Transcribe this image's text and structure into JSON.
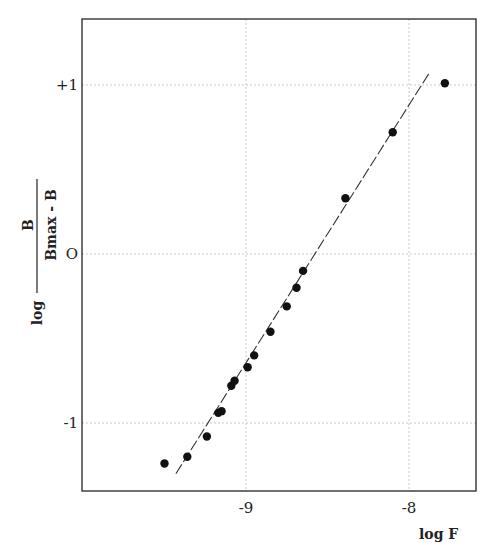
{
  "chart_data": {
    "type": "scatter",
    "title": "",
    "xlabel": "log F",
    "ylabel": "log B / (Bmax - B)",
    "ylabel_parts": {
      "log": "log",
      "numerator": "B",
      "denominator": "Bmax - B"
    },
    "xlim": [
      -9.5,
      -7.8
    ],
    "ylim": [
      -1.4,
      1.4
    ],
    "x_ticks": [
      {
        "value": -9,
        "label": "-9"
      },
      {
        "value": -8,
        "label": "-8"
      }
    ],
    "y_ticks": [
      {
        "value": 1,
        "label": "+1"
      },
      {
        "value": 0,
        "label": "O"
      },
      {
        "value": -1,
        "label": "-1"
      }
    ],
    "grid": "dotted at ticks",
    "legend": null,
    "series": [
      {
        "name": "data",
        "marker": "filled-circle",
        "points": [
          {
            "x": -9.5,
            "y": -1.24
          },
          {
            "x": -9.36,
            "y": -1.2
          },
          {
            "x": -9.24,
            "y": -1.08
          },
          {
            "x": -9.17,
            "y": -0.94
          },
          {
            "x": -9.15,
            "y": -0.93
          },
          {
            "x": -9.09,
            "y": -0.78
          },
          {
            "x": -9.07,
            "y": -0.75
          },
          {
            "x": -8.99,
            "y": -0.67
          },
          {
            "x": -8.95,
            "y": -0.6
          },
          {
            "x": -8.85,
            "y": -0.46
          },
          {
            "x": -8.75,
            "y": -0.31
          },
          {
            "x": -8.69,
            "y": -0.2
          },
          {
            "x": -8.65,
            "y": -0.1
          },
          {
            "x": -8.39,
            "y": 0.33
          },
          {
            "x": -8.1,
            "y": 0.72
          },
          {
            "x": -7.78,
            "y": 1.01
          }
        ]
      },
      {
        "name": "fit",
        "type": "line",
        "style": "dashed",
        "points": [
          {
            "x": -9.43,
            "y": -1.3
          },
          {
            "x": -7.87,
            "y": 1.08
          }
        ]
      }
    ]
  },
  "axes": {
    "frame": {
      "left": 82,
      "top": 19,
      "right": 476,
      "bottom": 491
    },
    "x_map": {
      "v0": -9,
      "p0": 246,
      "v1": -8,
      "p1": 409
    },
    "y_map": {
      "v0": 0,
      "p0": 254,
      "v1": 1,
      "p1": 85
    }
  }
}
